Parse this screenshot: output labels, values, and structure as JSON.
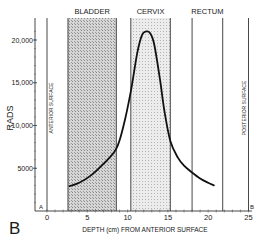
{
  "panel_label": "B",
  "chart_data": {
    "type": "line",
    "title": "",
    "xlabel": "DEPTH (cm) FROM ANTERIOR SURFACE",
    "ylabel": "RADS",
    "xlim": [
      0,
      25
    ],
    "ylim": [
      0,
      22000
    ],
    "x_ticks": [
      0,
      5,
      10,
      15,
      20,
      25
    ],
    "y_ticks": [
      5000,
      10000,
      15000,
      20000
    ],
    "y_tick_labels": [
      "5000",
      "10,000",
      "15,000",
      "20,000"
    ],
    "x_tick_labels": [
      "0",
      "5",
      "10",
      "15",
      "20",
      "25"
    ],
    "axis_end_labels": {
      "left": "A",
      "right": "B"
    },
    "grid": false,
    "legend": null,
    "regions": [
      {
        "label": "BLADDER",
        "x_start": 2.6,
        "x_end": 8.6,
        "shaded": true
      },
      {
        "label": "CERVIX",
        "x_start": 10.4,
        "x_end": 15.3,
        "shaded": true
      },
      {
        "label": "RECTUM",
        "x_start": 18.0,
        "x_end": 21.8,
        "shaded": false
      }
    ],
    "surface_lines": [
      {
        "label": "ANTERIOR SURFACE",
        "x": 0
      },
      {
        "label": "POSTERIOR SURFACE",
        "x": 25
      }
    ],
    "series": [
      {
        "name": "Dose",
        "x": [
          2.8,
          4.0,
          5.5,
          7.0,
          8.6,
          9.5,
          10.4,
          11.2,
          11.8,
          12.3,
          12.8,
          13.3,
          14.0,
          14.6,
          15.3,
          16.2,
          17.0,
          18.0,
          19.0,
          20.0,
          20.7
        ],
        "y": [
          2900,
          3300,
          4200,
          5500,
          7300,
          10000,
          14000,
          18500,
          20600,
          21000,
          20800,
          19500,
          15500,
          11500,
          8200,
          6300,
          5300,
          4500,
          3800,
          3300,
          3000
        ]
      }
    ]
  }
}
